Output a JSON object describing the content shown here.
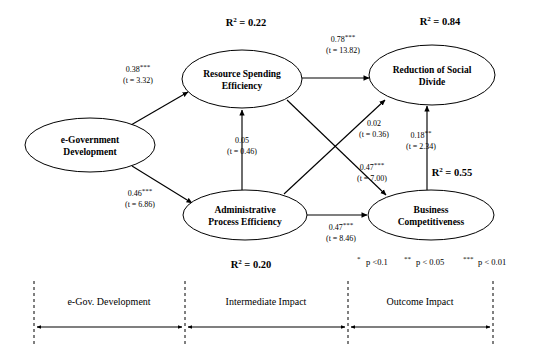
{
  "figure": {
    "type": "path-diagram",
    "nodes": [
      {
        "id": "egov",
        "label_line1": "e-Government",
        "label_line2": "Development",
        "cx": 90,
        "cy": 145,
        "rx": 65,
        "ry": 27
      },
      {
        "id": "rse",
        "label_line1": "Resource Spending",
        "label_line2": "Efficiency",
        "cx": 242,
        "cy": 79,
        "rx": 60,
        "ry": 29
      },
      {
        "id": "ape",
        "label_line1": "Administrative",
        "label_line2": "Process Efficiency",
        "cx": 245,
        "cy": 215,
        "rx": 62,
        "ry": 25
      },
      {
        "id": "rsd",
        "label_line1": "Reduction of Social",
        "label_line2": "Divide",
        "cx": 432,
        "cy": 75,
        "rx": 63,
        "ry": 30
      },
      {
        "id": "bc",
        "label_line1": "Business",
        "label_line2": "Competitiveness",
        "cx": 431,
        "cy": 215,
        "rx": 63,
        "ry": 25
      }
    ],
    "r2_values": [
      {
        "node": "rse",
        "text": "R",
        "sup": "2",
        "eq": " = 0.22",
        "x": 246,
        "y": 26
      },
      {
        "node": "rsd",
        "text": "R",
        "sup": "2",
        "eq": " = 0.84",
        "x": 440,
        "y": 25
      },
      {
        "node": "bc",
        "text": "R",
        "sup": "2",
        "eq": " = 0.55",
        "x": 452,
        "y": 176
      },
      {
        "node": "ape",
        "text": "R",
        "sup": "2",
        "eq": " = 0.20",
        "x": 251,
        "y": 268
      }
    ],
    "paths": [
      {
        "from": "egov",
        "to": "rse",
        "coefficient": "0.38",
        "stars": "***",
        "t_value": "(t = 3.32)",
        "label_x": 138,
        "label_y": 72
      },
      {
        "from": "egov",
        "to": "ape",
        "coefficient": "0.46",
        "stars": "***",
        "t_value": "(t = 6.86)",
        "label_x": 140,
        "label_y": 196
      },
      {
        "from": "rse",
        "to": "rsd",
        "coefficient": "0.78",
        "stars": "***",
        "t_value": "(t = 13.82)",
        "label_x": 343,
        "label_y": 42
      },
      {
        "from": "ape",
        "to": "rse",
        "coefficient": "0.05",
        "stars": "",
        "t_value": "(t = 0.46)",
        "label_x": 242,
        "label_y": 143
      },
      {
        "from": "ape",
        "to": "rsd",
        "coefficient": "0.02",
        "stars": "",
        "t_value": "(t = 0.36)",
        "label_x": 374,
        "label_y": 126
      },
      {
        "from": "rse",
        "to": "bc",
        "coefficient": "0.47",
        "stars": "***",
        "t_value": "(t = 7.00)",
        "label_x": 372,
        "label_y": 170
      },
      {
        "from": "bc",
        "to": "rsd",
        "coefficient": "0.18",
        "stars": "**",
        "t_value": "(t = 2.34)",
        "label_x": 421,
        "label_y": 138
      },
      {
        "from": "ape",
        "to": "bc",
        "coefficient": "0.47",
        "stars": "***",
        "t_value": "(t = 8.46)",
        "label_x": 341,
        "label_y": 230
      }
    ],
    "significance_legend": [
      {
        "stars": "*",
        "text": "p <0.1"
      },
      {
        "stars": "**",
        "text": "p < 0.05"
      },
      {
        "stars": "***",
        "text": "p < 0.01"
      }
    ],
    "bands": [
      {
        "label": "e-Gov. Development",
        "center_x": 109,
        "left": 34,
        "right": 185
      },
      {
        "label": "Intermediate Impact",
        "center_x": 266,
        "left": 185,
        "right": 348
      },
      {
        "label": "Outcome Impact",
        "center_x": 420,
        "left": 348,
        "right": 493
      }
    ],
    "band_dividers": [
      34,
      185,
      348,
      493
    ],
    "colors": {
      "stroke": "#000000",
      "background": "#ffffff",
      "text": "#000000"
    }
  }
}
